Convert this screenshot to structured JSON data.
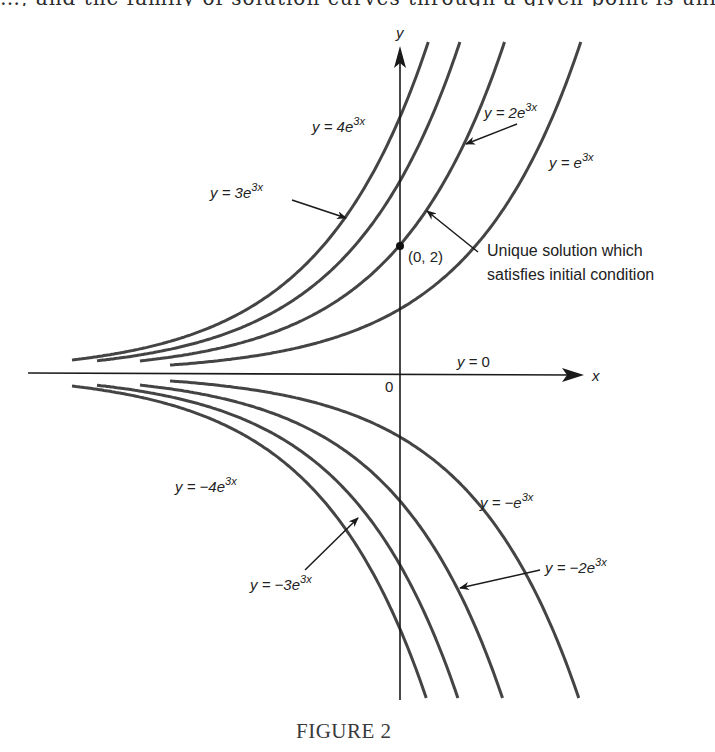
{
  "top_text_fragment": "…, and the family of solution curves through a given point is unique…",
  "figure": {
    "caption": "FIGURE 2",
    "axes": {
      "x_label": "x",
      "y_label": "y",
      "origin_label": "0",
      "x_axis_label": "y = 0"
    },
    "point": {
      "label": "(0, 2)",
      "x": 0,
      "y": 2
    },
    "annotation": {
      "line1": "Unique solution which",
      "line2": "satisfies initial condition"
    },
    "curve_labels": [
      {
        "id": "c4",
        "prefix": "y = 4e",
        "sup": "3x"
      },
      {
        "id": "c3",
        "prefix": "y = 3e",
        "sup": "3x"
      },
      {
        "id": "c2",
        "prefix": "y = 2e",
        "sup": "3x"
      },
      {
        "id": "c1",
        "prefix": "y = e",
        "sup": "3x"
      },
      {
        "id": "cm1",
        "prefix": "y = −e",
        "sup": "3x"
      },
      {
        "id": "cm2",
        "prefix": "y = −2e",
        "sup": "3x"
      },
      {
        "id": "cm3",
        "prefix": "y = −3e",
        "sup": "3x"
      },
      {
        "id": "cm4",
        "prefix": "y = −4e",
        "sup": "3x"
      }
    ]
  },
  "chart_data": {
    "type": "line",
    "title": "FIGURE 2",
    "xlabel": "x",
    "ylabel": "y",
    "function_family": "y = C e^{3x}",
    "series": [
      {
        "name": "y = 4e^{3x}",
        "C": 4
      },
      {
        "name": "y = 3e^{3x}",
        "C": 3
      },
      {
        "name": "y = 2e^{3x}",
        "C": 2,
        "highlight": "Unique solution which satisfies initial condition (0, 2)"
      },
      {
        "name": "y = e^{3x}",
        "C": 1
      },
      {
        "name": "y = 0",
        "C": 0
      },
      {
        "name": "y = -e^{3x}",
        "C": -1
      },
      {
        "name": "y = -2e^{3x}",
        "C": -2
      },
      {
        "name": "y = -3e^{3x}",
        "C": -3
      },
      {
        "name": "y = -4e^{3x}",
        "C": -4
      }
    ],
    "y_intercepts": [
      4,
      3,
      2,
      1,
      0,
      -1,
      -2,
      -3,
      -4
    ],
    "marked_point": [
      0,
      2
    ],
    "xlim": [
      -1.1,
      0.55
    ],
    "ylim": [
      -5.2,
      5.2
    ],
    "grid": false,
    "legend": "inline labels with arrows"
  }
}
